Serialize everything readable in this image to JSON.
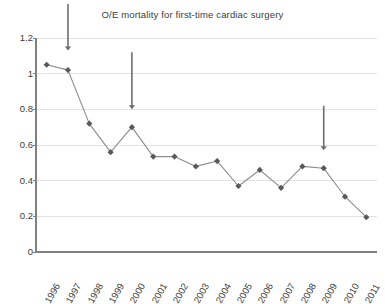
{
  "chart_data": {
    "type": "line",
    "title": "O/E mortality for first-time cardiac surgery",
    "xlabel": "",
    "ylabel": "",
    "categories": [
      "1996",
      "1997",
      "1998",
      "1999",
      "2000",
      "2001",
      "2002",
      "2003",
      "2004",
      "2005",
      "2006",
      "2007",
      "2008",
      "2009",
      "2010",
      "2011"
    ],
    "values": [
      1.05,
      1.02,
      0.72,
      0.56,
      0.7,
      0.535,
      0.535,
      0.48,
      0.51,
      0.37,
      0.46,
      0.36,
      0.48,
      0.47,
      0.31,
      0.195
    ],
    "series": [
      {
        "name": "O/E mortality",
        "values": [
          1.05,
          1.02,
          0.72,
          0.56,
          0.7,
          0.535,
          0.535,
          0.48,
          0.51,
          0.37,
          0.46,
          0.36,
          0.48,
          0.47,
          0.31,
          0.195
        ]
      }
    ],
    "ylim": [
      0,
      1.2
    ],
    "yticks": [
      0,
      0.2,
      0.4,
      0.6,
      0.8,
      1,
      1.2
    ],
    "ytick_labels": [
      "0",
      "0.2",
      "0.4",
      "0.6",
      "0.8",
      "1",
      "1.2"
    ],
    "grid": true,
    "grid_axis": "y",
    "legend": false,
    "legend_position": "none",
    "marker": "diamond",
    "marker_color": "#595959",
    "line_color": "#8c8c8c",
    "axis_color": "#808080",
    "grid_color": "#e3e3e3",
    "annotations": [
      {
        "label": "arrow-1997",
        "x_category": "1997",
        "tip_value": 1.13,
        "tail_value": 1.39,
        "direction": "down"
      },
      {
        "label": "arrow-2000",
        "x_category": "2000",
        "tip_value": 0.8,
        "tail_value": 1.12,
        "direction": "down"
      },
      {
        "label": "arrow-2009",
        "x_category": "2009",
        "tip_value": 0.57,
        "tail_value": 0.82,
        "direction": "down"
      }
    ],
    "annotation_color": "#6e6e6e"
  }
}
